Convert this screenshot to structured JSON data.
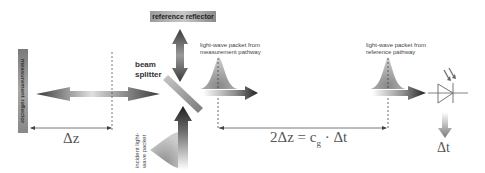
{
  "labels": {
    "reference_reflector": "reference reflector",
    "measurement_reflector": "measurement reflector",
    "beam_splitter_line1": "beam",
    "beam_splitter_line2": "splitter",
    "packet_measurement_line1": "light-wave packet from",
    "packet_measurement_line2": "measurement pathway",
    "packet_reference_line1": "light-wave packet from",
    "packet_reference_line2": "reference pathway",
    "incident_line1": "incident light-",
    "incident_line2": "wave packet"
  },
  "math": {
    "delta_z": "Δz",
    "equation_lhs": "2Δz = c",
    "equation_sub": "g",
    "equation_rhs": " · Δt",
    "delta_t": "Δt"
  },
  "icons": {
    "detector": "photodiode-icon",
    "splitter": "beam-splitter-icon"
  },
  "colors": {
    "arrow_dark": "#2e2e2e",
    "arrow_light": "#d8d8d8",
    "packet_fill": "#9a9a9a",
    "line": "#555555"
  }
}
